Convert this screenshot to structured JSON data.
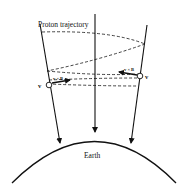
{
  "diagram": {
    "labels": {
      "title": "Proton trajectory",
      "earth": "Earth",
      "velocity_left": "v",
      "velocity_right": "v",
      "force_left": "v × B",
      "force_right": "v × B"
    },
    "colors": {
      "line": "#111111",
      "background": "#ffffff"
    }
  }
}
